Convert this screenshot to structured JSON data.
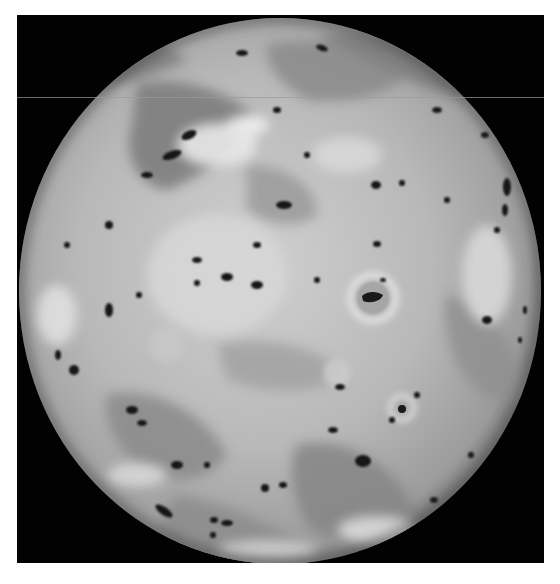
{
  "image": {
    "subject": "Io (moon of Jupiter)",
    "alt": "Grayscale full-disk photograph of Io showing volcanic hotspots, dark lava spots, and bright ring-shaped plume deposits",
    "colors": {
      "background": "#ffffff",
      "frame": "#020202",
      "surface_light": "#d6d6d6",
      "surface_mid": "#a8a8a8",
      "surface_dark": "#6a6a6a",
      "spot": "#141414",
      "scanline": "#9a9a9a"
    },
    "frame": {
      "x": 17,
      "y": 15,
      "width": 527,
      "height": 548
    },
    "sphere": {
      "cx": 263,
      "cy": 276,
      "rx": 261,
      "ry": 273
    },
    "features": {
      "ring_craters": [
        {
          "cx": 356,
          "cy": 283,
          "r": 22
        },
        {
          "cx": 385,
          "cy": 393,
          "r": 12
        }
      ],
      "scanline_y": 82
    }
  }
}
